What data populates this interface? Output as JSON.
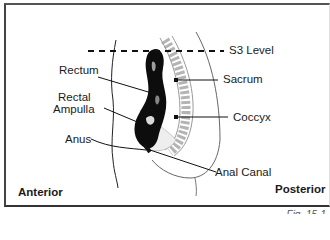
{
  "figure": {
    "caption": "Fig. 15-1",
    "orientation": {
      "left": "Anterior",
      "right": "Posterior"
    },
    "reference_line": "S3 Level",
    "labels": {
      "rectum": "Rectum",
      "rectal_ampulla_line1": "Rectal",
      "rectal_ampulla_line2": "Ampulla",
      "anus": "Anus",
      "sacrum": "Sacrum",
      "coccyx": "Coccyx",
      "anal_canal": "Anal Canal"
    },
    "colors": {
      "ink": "#111111",
      "frame": "#444444",
      "background": "#ffffff"
    }
  }
}
